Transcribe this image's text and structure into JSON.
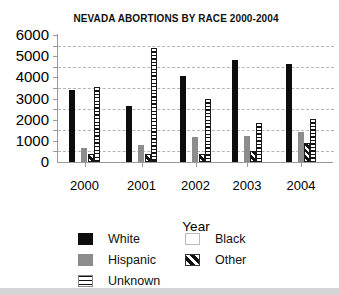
{
  "chart_data": {
    "type": "bar",
    "title": "NEVADA ABORTIONS BY RACE 2000-2004",
    "xlabel": "Year",
    "ylabel": "",
    "categories": [
      "2000",
      "2001",
      "2002",
      "2003",
      "2004"
    ],
    "series": [
      {
        "name": "White",
        "pattern": "solid-black",
        "values": [
          3400,
          2650,
          4050,
          4800,
          4650
        ]
      },
      {
        "name": "Black",
        "pattern": "white-invisible",
        "values": [
          null,
          null,
          null,
          null,
          null
        ],
        "visible_in_chart": false
      },
      {
        "name": "Hispanic",
        "pattern": "solid-gray",
        "values": [
          650,
          800,
          1200,
          1250,
          1400
        ]
      },
      {
        "name": "Other",
        "pattern": "diagonal-hatch",
        "values": [
          400,
          400,
          400,
          500,
          900
        ]
      },
      {
        "name": "Unknown",
        "pattern": "horizontal-stripes",
        "values": [
          3550,
          5400,
          3000,
          1850,
          2050
        ]
      }
    ],
    "bar_order": [
      "White",
      "Black",
      "Hispanic",
      "Other",
      "Unknown"
    ],
    "ylim": [
      0,
      6000
    ],
    "ytick_step": 1000,
    "ytick_labels": [
      "0",
      "1000",
      "2000",
      "3000",
      "4000",
      "5000",
      "6000"
    ],
    "minor_tick_step": 500,
    "gridlines_at": [
      500,
      1500,
      2500,
      3500,
      4500,
      5500
    ],
    "grid_style": "dashed",
    "legend_position": "bottom"
  },
  "legend": {
    "columns": [
      {
        "items": [
          {
            "label": "White",
            "swatch": "solid-black"
          },
          {
            "label": "Hispanic",
            "swatch": "solid-gray"
          },
          {
            "label": "Unknown",
            "swatch": "horizontal-stripes"
          }
        ]
      },
      {
        "items": [
          {
            "label": "Black",
            "swatch": "white-box"
          },
          {
            "label": "Other",
            "swatch": "diagonal-hatch"
          }
        ]
      }
    ]
  },
  "colors": {
    "background": "#ffffff",
    "bar_black": "#0d0d0d",
    "bar_gray": "#8c8c8c",
    "axis": "#9a9a9a",
    "gridline": "#b5b5b5",
    "text": "#000000",
    "bottom_strip": "#d5d5d5"
  }
}
